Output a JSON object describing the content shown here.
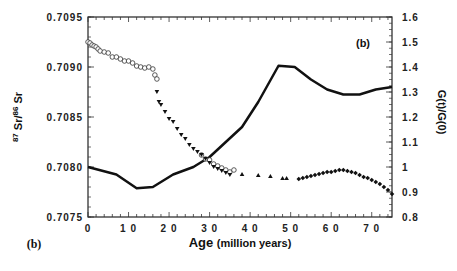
{
  "chart_data": {
    "type": "scatter",
    "title": "",
    "panel_label": "(b)",
    "panel_label_bottom": "(b)",
    "xlabel": "Age (million years)",
    "xlabel_main": "Age",
    "xlabel_unit": "(million years)",
    "ylabel_left": "87Sr/86Sr",
    "ylabel_right": "G(t)/G(0)",
    "xlim": [
      0,
      75
    ],
    "ylim_left": [
      0.7075,
      0.7095
    ],
    "ylim_right": [
      0.8,
      1.6
    ],
    "x_ticks": [
      "0",
      "10",
      "20",
      "30",
      "40",
      "50",
      "60",
      "70"
    ],
    "y_ticks_left": [
      "0.7095",
      "0.7090",
      "0.7085",
      "0.7080",
      "0.7075"
    ],
    "y_ticks_right": [
      "1.6",
      "1.5",
      "1.4",
      "1.3",
      "1.2",
      "1.1",
      "1",
      "0.9",
      "0.8"
    ],
    "grid": false,
    "series": [
      {
        "name": "G(t)/G(0)",
        "type": "line",
        "axis": "right",
        "x": [
          0,
          7,
          12,
          16,
          21,
          26,
          30,
          34,
          38,
          42,
          47,
          51,
          55,
          59,
          63,
          67,
          71,
          75
        ],
        "y": [
          1.0,
          0.97,
          0.915,
          0.92,
          0.97,
          1.0,
          1.04,
          1.1,
          1.16,
          1.26,
          1.405,
          1.4,
          1.35,
          1.31,
          1.29,
          1.29,
          1.31,
          1.32
        ]
      },
      {
        "name": "Sr isotope data (open circles)",
        "type": "scatter",
        "marker": "circle-open",
        "axis": "left",
        "x": [
          0,
          0.5,
          1,
          1.5,
          2,
          2.5,
          3,
          4,
          5,
          6,
          7,
          8,
          9,
          10,
          11,
          12,
          13,
          14,
          15,
          16,
          16.5,
          17,
          28,
          29,
          30,
          31,
          32,
          33,
          34,
          35,
          36
        ],
        "y": [
          0.70925,
          0.70924,
          0.70922,
          0.70921,
          0.7092,
          0.70918,
          0.70916,
          0.70915,
          0.70914,
          0.7091,
          0.7091,
          0.70908,
          0.70906,
          0.70906,
          0.70904,
          0.70901,
          0.709,
          0.70899,
          0.709,
          0.70898,
          0.70892,
          0.70888,
          0.70812,
          0.70808,
          0.70807,
          0.70803,
          0.70801,
          0.70799,
          0.70797,
          0.70795,
          0.70797
        ]
      },
      {
        "name": "Sr isotope data (filled inverted triangles)",
        "type": "scatter",
        "marker": "triangle-down-filled",
        "axis": "left",
        "x": [
          17,
          17.5,
          18,
          19,
          20,
          21,
          22,
          23,
          24,
          25,
          26,
          27,
          28,
          29,
          30,
          31,
          32,
          33,
          34,
          35
        ],
        "y": [
          0.70875,
          0.70865,
          0.70862,
          0.70855,
          0.70848,
          0.70845,
          0.70838,
          0.70832,
          0.70828,
          0.70822,
          0.70818,
          0.70815,
          0.70812,
          0.70808,
          0.70804,
          0.708,
          0.70798,
          0.70796,
          0.70794,
          0.70792
        ]
      },
      {
        "name": "Sr isotope data (filled triangles)",
        "type": "scatter",
        "marker": "triangle-up-filled",
        "axis": "left",
        "x": [
          38,
          42,
          45,
          48,
          49
        ],
        "y": [
          0.70793,
          0.70792,
          0.70791,
          0.70789,
          0.70789
        ]
      },
      {
        "name": "Sr isotope data (filled diamonds)",
        "type": "scatter",
        "marker": "diamond-filled",
        "axis": "left",
        "x": [
          52,
          53,
          54,
          55,
          56,
          57,
          58,
          59,
          60,
          61,
          62,
          63,
          64,
          65,
          66,
          67,
          68,
          69,
          70,
          71,
          72,
          73,
          74,
          75
        ],
        "y": [
          0.70788,
          0.70789,
          0.7079,
          0.70791,
          0.70792,
          0.70793,
          0.70794,
          0.70795,
          0.70795,
          0.70796,
          0.70797,
          0.70797,
          0.70796,
          0.70795,
          0.70794,
          0.70792,
          0.7079,
          0.70789,
          0.70787,
          0.70785,
          0.70783,
          0.7078,
          0.70777,
          0.70773
        ]
      }
    ]
  }
}
